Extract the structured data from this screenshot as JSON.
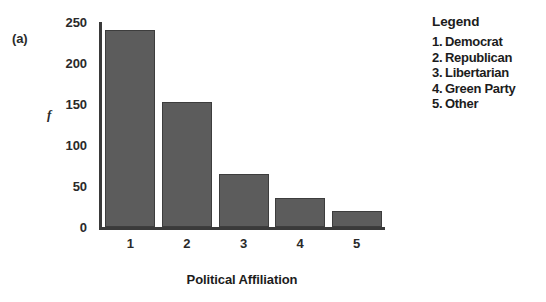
{
  "panel": {
    "label": "(a)"
  },
  "chart_data": {
    "type": "bar",
    "title": "",
    "xlabel": "Political Affiliation",
    "ylabel": "f",
    "categories": [
      "1",
      "2",
      "3",
      "4",
      "5"
    ],
    "values": [
      240,
      152,
      65,
      35,
      20
    ],
    "ylim": [
      0,
      250
    ],
    "yticks": [
      0,
      50,
      100,
      150,
      200,
      250
    ],
    "ytick_labels": [
      "0",
      "50",
      "100",
      "150",
      "200",
      "250"
    ],
    "grid": false,
    "legend_position": "right",
    "bar_color": "#5c5c5c",
    "bar_edge_color": "#3d3d3d",
    "axis_color": "#3a3a3a"
  },
  "legend": {
    "title": "Legend",
    "items": [
      {
        "num": "1.",
        "label": "Democrat"
      },
      {
        "num": "2.",
        "label": "Republican"
      },
      {
        "num": "3.",
        "label": "Libertarian"
      },
      {
        "num": "4.",
        "label": "Green Party"
      },
      {
        "num": "5.",
        "label": "Other"
      }
    ]
  }
}
